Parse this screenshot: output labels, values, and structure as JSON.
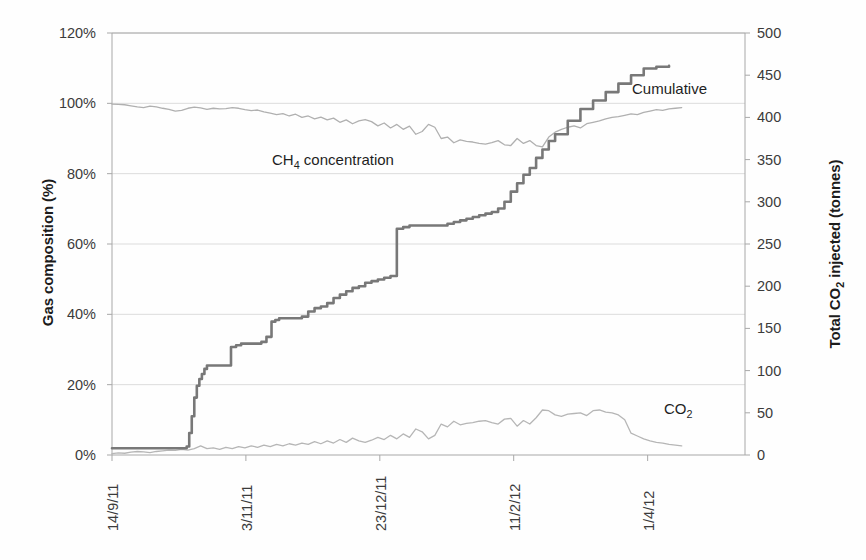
{
  "chart_data": {
    "type": "line",
    "title": "",
    "xlabel": "",
    "grid": "horizontal",
    "legend_position": "inline-annotations",
    "axes": {
      "y_left": {
        "label": "Gas composition (%)",
        "ticks": [
          "0%",
          "20%",
          "40%",
          "60%",
          "80%",
          "100%",
          "120%"
        ],
        "tick_values": [
          0,
          20,
          40,
          60,
          80,
          100,
          120
        ],
        "ylim": [
          0,
          120
        ],
        "unit": "%"
      },
      "y_right": {
        "label": "Total CO2 injected (tonnes)",
        "ticks": [
          "0",
          "50",
          "100",
          "150",
          "200",
          "250",
          "300",
          "350",
          "400",
          "450",
          "500"
        ],
        "tick_values": [
          0,
          50,
          100,
          150,
          200,
          250,
          300,
          350,
          400,
          450,
          500
        ],
        "ylim": [
          0,
          500
        ],
        "unit": "tonnes"
      },
      "x": {
        "ticks": [
          "14/9/11",
          "3/11/11",
          "23/12/11",
          "11/2/12",
          "1/4/12"
        ],
        "tick_fraction": [
          0.0,
          0.2115,
          0.4231,
          0.6346,
          0.8462
        ],
        "rotation": -90
      }
    },
    "series": [
      {
        "name": "Cumulative",
        "annotation": "Cumulative",
        "axis": "y_right",
        "color": "#787878",
        "style": "step",
        "x": [
          0.0,
          0.01,
          0.02,
          0.03,
          0.045,
          0.06,
          0.075,
          0.09,
          0.1,
          0.11,
          0.118,
          0.122,
          0.126,
          0.13,
          0.134,
          0.138,
          0.142,
          0.146,
          0.15,
          0.156,
          0.162,
          0.168,
          0.174,
          0.18,
          0.188,
          0.196,
          0.204,
          0.212,
          0.22,
          0.228,
          0.236,
          0.244,
          0.252,
          0.258,
          0.264,
          0.27,
          0.276,
          0.282,
          0.288,
          0.294,
          0.3,
          0.31,
          0.32,
          0.33,
          0.34,
          0.35,
          0.36,
          0.37,
          0.38,
          0.39,
          0.4,
          0.41,
          0.42,
          0.43,
          0.44,
          0.45,
          0.46,
          0.47,
          0.48,
          0.49,
          0.5,
          0.51,
          0.52,
          0.53,
          0.54,
          0.55,
          0.56,
          0.57,
          0.58,
          0.59,
          0.6,
          0.61,
          0.62,
          0.63,
          0.64,
          0.65,
          0.66,
          0.67,
          0.68,
          0.69,
          0.7,
          0.72,
          0.74,
          0.76,
          0.78,
          0.8,
          0.82,
          0.84,
          0.86,
          0.88
        ],
        "y": [
          8,
          8,
          8,
          8,
          8,
          8,
          8,
          8,
          8,
          8,
          10,
          26,
          46,
          68,
          82,
          90,
          96,
          102,
          106,
          106,
          106,
          106,
          106,
          106,
          128,
          130,
          132,
          132,
          132,
          132,
          134,
          140,
          158,
          160,
          162,
          162,
          162,
          162,
          162,
          162,
          164,
          170,
          174,
          176,
          180,
          186,
          190,
          194,
          198,
          200,
          204,
          206,
          208,
          210,
          212,
          268,
          270,
          272,
          272,
          272,
          272,
          272,
          272,
          274,
          276,
          278,
          280,
          282,
          284,
          286,
          288,
          292,
          300,
          312,
          322,
          332,
          340,
          352,
          362,
          372,
          380,
          396,
          410,
          420,
          430,
          440,
          450,
          458,
          460,
          461
        ]
      },
      {
        "name": "CH4 concentration",
        "annotation": "CH4 concentration",
        "axis": "y_left",
        "color": "#b0b0b0",
        "style": "line",
        "x": [
          0.0,
          0.01,
          0.02,
          0.03,
          0.04,
          0.05,
          0.06,
          0.07,
          0.08,
          0.09,
          0.1,
          0.11,
          0.12,
          0.13,
          0.14,
          0.15,
          0.16,
          0.17,
          0.18,
          0.19,
          0.2,
          0.21,
          0.22,
          0.23,
          0.24,
          0.25,
          0.26,
          0.27,
          0.28,
          0.29,
          0.3,
          0.31,
          0.32,
          0.33,
          0.34,
          0.35,
          0.36,
          0.37,
          0.38,
          0.39,
          0.4,
          0.41,
          0.42,
          0.43,
          0.44,
          0.45,
          0.46,
          0.47,
          0.48,
          0.49,
          0.5,
          0.51,
          0.52,
          0.53,
          0.54,
          0.55,
          0.56,
          0.57,
          0.58,
          0.59,
          0.6,
          0.61,
          0.62,
          0.63,
          0.64,
          0.65,
          0.66,
          0.67,
          0.68,
          0.69,
          0.7,
          0.71,
          0.72,
          0.73,
          0.74,
          0.75,
          0.76,
          0.77,
          0.78,
          0.79,
          0.8,
          0.81,
          0.82,
          0.83,
          0.84,
          0.85,
          0.86,
          0.87,
          0.88,
          0.89,
          0.9
        ],
        "y": [
          99.8,
          99.7,
          99.6,
          99.3,
          99.0,
          98.8,
          99.2,
          99.0,
          98.6,
          98.3,
          97.8,
          98.0,
          98.6,
          98.9,
          98.7,
          98.3,
          98.6,
          98.4,
          98.5,
          98.8,
          98.6,
          98.2,
          97.9,
          98.1,
          97.6,
          97.2,
          96.8,
          97.1,
          96.4,
          96.9,
          96.0,
          96.4,
          95.6,
          96.1,
          95.3,
          95.8,
          94.6,
          95.3,
          94.2,
          95.0,
          95.4,
          94.8,
          93.6,
          94.4,
          93.0,
          94.0,
          92.6,
          93.5,
          91.2,
          92.0,
          94.0,
          93.2,
          90.0,
          90.4,
          88.8,
          89.6,
          89.2,
          89.0,
          88.6,
          88.4,
          88.8,
          89.4,
          88.2,
          88.0,
          90.0,
          88.6,
          89.4,
          88.0,
          87.6,
          90.4,
          91.8,
          92.6,
          93.2,
          93.6,
          93.0,
          94.2,
          94.6,
          95.0,
          95.6,
          96.0,
          96.2,
          96.6,
          97.0,
          96.8,
          97.4,
          97.8,
          98.2,
          98.0,
          98.4,
          98.6,
          98.8
        ]
      },
      {
        "name": "CO2",
        "annotation": "CO2",
        "axis": "y_left",
        "color": "#b6b6b6",
        "style": "line",
        "x": [
          0.0,
          0.01,
          0.02,
          0.03,
          0.04,
          0.05,
          0.06,
          0.07,
          0.08,
          0.09,
          0.1,
          0.11,
          0.12,
          0.13,
          0.14,
          0.15,
          0.16,
          0.17,
          0.18,
          0.19,
          0.2,
          0.21,
          0.22,
          0.23,
          0.24,
          0.25,
          0.26,
          0.27,
          0.28,
          0.29,
          0.3,
          0.31,
          0.32,
          0.33,
          0.34,
          0.35,
          0.36,
          0.37,
          0.38,
          0.39,
          0.4,
          0.41,
          0.42,
          0.43,
          0.44,
          0.45,
          0.46,
          0.47,
          0.48,
          0.49,
          0.5,
          0.51,
          0.52,
          0.53,
          0.54,
          0.55,
          0.56,
          0.57,
          0.58,
          0.59,
          0.6,
          0.61,
          0.62,
          0.63,
          0.64,
          0.65,
          0.66,
          0.67,
          0.68,
          0.69,
          0.7,
          0.71,
          0.72,
          0.73,
          0.74,
          0.75,
          0.76,
          0.77,
          0.78,
          0.79,
          0.8,
          0.81,
          0.82,
          0.83,
          0.84,
          0.85,
          0.86,
          0.87,
          0.88,
          0.89,
          0.9
        ],
        "y": [
          0.4,
          0.6,
          0.5,
          0.8,
          1.0,
          0.9,
          0.7,
          1.0,
          1.2,
          1.4,
          1.3,
          1.6,
          1.4,
          1.8,
          2.6,
          1.8,
          2.0,
          1.6,
          2.2,
          1.8,
          2.4,
          2.0,
          2.6,
          2.2,
          2.8,
          2.4,
          3.0,
          2.6,
          3.2,
          2.8,
          3.4,
          3.0,
          3.8,
          3.2,
          4.0,
          3.4,
          4.4,
          3.6,
          4.8,
          4.0,
          3.6,
          4.2,
          5.0,
          4.4,
          5.6,
          4.6,
          6.0,
          5.0,
          7.4,
          6.6,
          4.6,
          5.6,
          8.8,
          8.0,
          9.6,
          8.6,
          9.0,
          9.2,
          9.6,
          9.8,
          9.2,
          8.8,
          10.2,
          10.4,
          8.2,
          9.8,
          8.8,
          10.6,
          12.8,
          12.6,
          11.4,
          11.0,
          11.6,
          11.8,
          12.0,
          11.2,
          12.6,
          12.8,
          12.2,
          12.0,
          11.4,
          10.0,
          6.2,
          5.4,
          4.6,
          4.0,
          3.6,
          3.4,
          3.0,
          2.8,
          2.6
        ]
      }
    ]
  },
  "plot": {
    "left": 112,
    "right": 745,
    "top": 33,
    "bottom": 455,
    "gridline_color": "#dcdcdc",
    "axis_color": "#a8a8a8"
  }
}
